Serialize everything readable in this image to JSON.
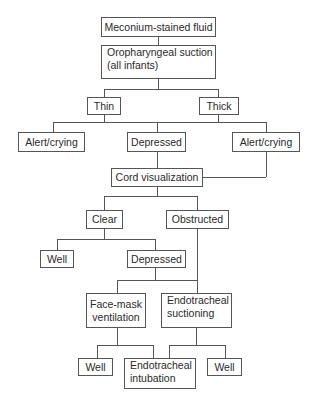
{
  "diagram": {
    "type": "flowchart",
    "colors": {
      "line": "#555555",
      "box_border": "#555555",
      "text": "#2a2a2a",
      "background": "#ffffff"
    },
    "nodes": {
      "meconium": {
        "label": "Meconium-stained fluid"
      },
      "suction": {
        "line1": "Oropharyngeal suction",
        "line2": "(all infants)"
      },
      "thin": {
        "label": "Thin"
      },
      "thick": {
        "label": "Thick"
      },
      "alert_left": {
        "label": "Alert/crying"
      },
      "depressed_1": {
        "label": "Depressed"
      },
      "alert_right": {
        "label": "Alert/crying"
      },
      "cord": {
        "label": "Cord visualization"
      },
      "clear": {
        "label": "Clear"
      },
      "obstructed": {
        "label": "Obstructed"
      },
      "well_1": {
        "label": "Well"
      },
      "depressed_2": {
        "label": "Depressed"
      },
      "facemask": {
        "line1": "Face-mask",
        "line2": "ventilation"
      },
      "et_suction": {
        "line1": "Endotracheal",
        "line2": "suctioning"
      },
      "well_2": {
        "label": "Well"
      },
      "intubation": {
        "line1": "Endotracheal",
        "line2": "intubation"
      },
      "well_3": {
        "label": "Well"
      }
    },
    "edges": [
      [
        "meconium",
        "suction"
      ],
      [
        "suction",
        "thin"
      ],
      [
        "suction",
        "thick"
      ],
      [
        "thin",
        "alert_left"
      ],
      [
        "thin",
        "depressed_1"
      ],
      [
        "thin",
        "alert_right"
      ],
      [
        "thick",
        "alert_left"
      ],
      [
        "thick",
        "depressed_1"
      ],
      [
        "thick",
        "alert_right"
      ],
      [
        "depressed_1",
        "cord"
      ],
      [
        "alert_right",
        "cord"
      ],
      [
        "cord",
        "clear"
      ],
      [
        "cord",
        "obstructed"
      ],
      [
        "clear",
        "well_1"
      ],
      [
        "clear",
        "depressed_2"
      ],
      [
        "obstructed",
        "et_suction"
      ],
      [
        "depressed_2",
        "facemask"
      ],
      [
        "depressed_2",
        "et_suction"
      ],
      [
        "facemask",
        "well_2"
      ],
      [
        "facemask",
        "intubation"
      ],
      [
        "et_suction",
        "intubation"
      ],
      [
        "et_suction",
        "well_3"
      ]
    ]
  }
}
